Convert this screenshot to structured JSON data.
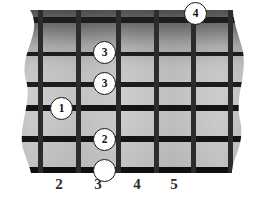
{
  "diagram": {
    "type": "fretboard",
    "colors": {
      "background": "#ffffff",
      "board_light": "#cfcfcf",
      "board_dark": "#4a4a4a",
      "string": "#1b1b1b",
      "fret": "#2a2a2a",
      "dot_fill": "#ffffff",
      "dot_stroke": "#151515",
      "label_text": "#2b2b2b"
    },
    "strings": {
      "count": 6,
      "orientation": "horizontal",
      "y_positions": [
        12,
        46,
        76,
        100,
        131,
        163
      ],
      "thicknesses": [
        5,
        4,
        5,
        6,
        6,
        7
      ]
    },
    "frets": {
      "orientation": "vertical",
      "x_positions": [
        40,
        78,
        118,
        156,
        193,
        230
      ],
      "thickness": 5
    },
    "fret_numbers": [
      {
        "label": "2",
        "x": 59
      },
      {
        "label": "3",
        "x": 98
      },
      {
        "label": "4",
        "x": 137
      },
      {
        "label": "5",
        "x": 174
      }
    ],
    "markers": [
      {
        "label": "4",
        "type": "numbered",
        "x": 196,
        "y": 6,
        "diameter": 23
      },
      {
        "label": "3",
        "type": "numbered",
        "x": 105,
        "y": 45,
        "diameter": 23
      },
      {
        "label": "3",
        "type": "numbered",
        "x": 105,
        "y": 76,
        "diameter": 23
      },
      {
        "label": "1",
        "type": "numbered",
        "x": 62,
        "y": 101,
        "diameter": 23
      },
      {
        "label": "2",
        "type": "numbered",
        "x": 105,
        "y": 132,
        "diameter": 23
      },
      {
        "label": "",
        "type": "open",
        "x": 105,
        "y": 163,
        "diameter": 23
      }
    ]
  }
}
